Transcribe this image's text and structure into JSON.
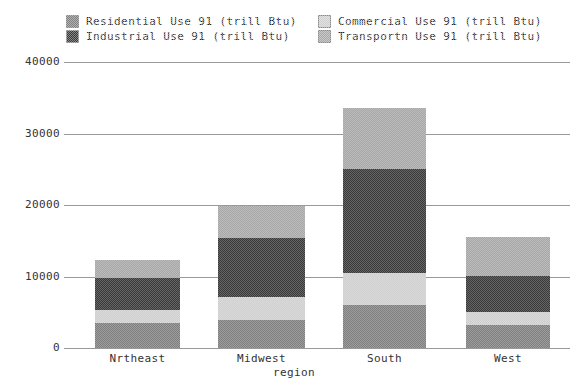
{
  "chart_data": {
    "type": "bar",
    "subtype": "stacked-bar",
    "title": "",
    "xlabel": "region",
    "ylabel": "",
    "categories": [
      "Nrtheast",
      "Midwest",
      "South",
      "West"
    ],
    "series": [
      {
        "name": "Residential Use 91 (trill Btu)",
        "values": [
          3500,
          3900,
          6000,
          3200
        ],
        "color": "#808080"
      },
      {
        "name": "Commercial Use 91 (trill Btu)",
        "values": [
          1800,
          3200,
          4500,
          1800
        ],
        "color": "#cfcfcf"
      },
      {
        "name": "Industrial Use 91 (trill Btu)",
        "values": [
          4500,
          8300,
          14500,
          5000
        ],
        "color": "#3a3a3a"
      },
      {
        "name": "Transportn Use 91 (trill Btu)",
        "values": [
          2500,
          4400,
          8500,
          5500
        ],
        "color": "#a8a8a8"
      }
    ],
    "totals": [
      12300,
      19800,
      33500,
      15500
    ],
    "ylim": [
      0,
      40000
    ],
    "yticks": [
      0,
      10000,
      20000,
      30000,
      40000
    ],
    "ytick_labels": [
      "0",
      "10000",
      "20000",
      "30000",
      "40000"
    ],
    "grid": true,
    "legend_position": "top",
    "stack_order_bottom_to_top": [
      "Residential",
      "Commercial",
      "Industrial",
      "Transportn"
    ]
  },
  "legend": {
    "rows": [
      [
        {
          "label": "Residential Use 91 (trill Btu)",
          "color": "#808080"
        },
        {
          "label": "Commercial Use 91 (trill Btu)",
          "color": "#cfcfcf"
        }
      ],
      [
        {
          "label": "Industrial Use 91 (trill Btu)",
          "color": "#3a3a3a"
        },
        {
          "label": "Transportn Use 91 (trill Btu)",
          "color": "#a8a8a8"
        }
      ]
    ]
  },
  "axes": {
    "x_title": "region",
    "x_labels": [
      "Nrtheast",
      "Midwest",
      "South",
      "West"
    ],
    "y_labels": [
      "40000",
      "30000",
      "20000",
      "10000",
      "0"
    ]
  },
  "colors": {
    "grid": "#9a9a9a",
    "text": "#333333",
    "background": "#ffffff",
    "bar_border": "#6a6a6a"
  }
}
